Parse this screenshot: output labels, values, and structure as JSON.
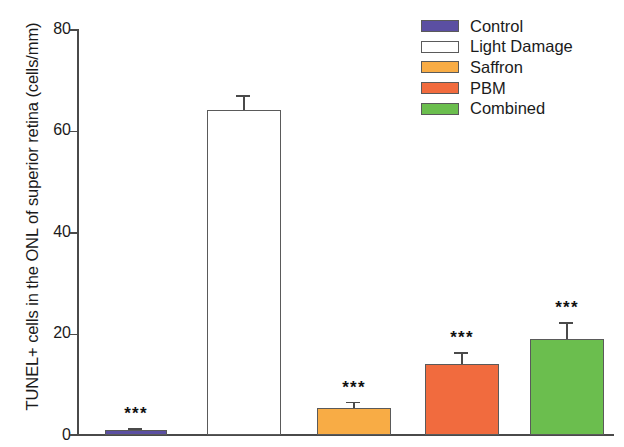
{
  "chart_data": {
    "type": "bar",
    "title": "",
    "xlabel": "",
    "ylabel": "TUNEL+ cells in the ONL of superior retina (cells/mm)",
    "ylim": [
      0,
      80
    ],
    "yticks": [
      0,
      20,
      40,
      60,
      80
    ],
    "ytick_labels": [
      "0",
      "20",
      "40",
      "60",
      "80"
    ],
    "grid": false,
    "legend_position": "top-right",
    "categories": [
      "Control",
      "Light Damage",
      "Saffron",
      "PBM",
      "Combined"
    ],
    "values": [
      1.0,
      64.0,
      5.3,
      14.0,
      19.0
    ],
    "errors": [
      0.4,
      3.0,
      1.3,
      2.3,
      3.2
    ],
    "annotations": [
      "***",
      "",
      "***",
      "***",
      "***"
    ],
    "colors": [
      "#5B4FA2",
      "#FFFFFF",
      "#F8AC45",
      "#F16B3E",
      "#6BBE4E"
    ],
    "series": [
      {
        "name": "TUNEL+ cells",
        "values": [
          1.0,
          64.0,
          5.3,
          14.0,
          19.0
        ]
      }
    ]
  },
  "legend": {
    "items": [
      {
        "label": "Control",
        "color": "#5B4FA2"
      },
      {
        "label": "Light Damage",
        "color": "#FFFFFF"
      },
      {
        "label": "Saffron",
        "color": "#F8AC45"
      },
      {
        "label": "PBM",
        "color": "#F16B3E"
      },
      {
        "label": "Combined",
        "color": "#6BBE4E"
      }
    ]
  },
  "axis": {
    "y_title": "TUNEL+ cells in the ONL of superior retina (cells/mm)",
    "y_tick_0": "0",
    "y_tick_1": "20",
    "y_tick_2": "40",
    "y_tick_3": "60",
    "y_tick_4": "80"
  }
}
